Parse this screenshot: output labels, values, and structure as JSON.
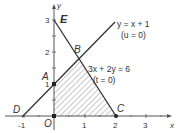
{
  "diagram": {
    "type": "linear-programming-feasible-region",
    "axes": {
      "x_label": "x",
      "y_label": "y",
      "x_ticks": [
        "-1",
        "1",
        "2",
        "3"
      ],
      "y_ticks": [
        "1",
        "2",
        "3"
      ],
      "origin_label": "O"
    },
    "lines": [
      {
        "equation": "y = x + 1",
        "constraint": "(u = 0)"
      },
      {
        "equation": "3x + 2y = 6",
        "constraint": "(t = 0)"
      }
    ],
    "points": {
      "A": "A",
      "B": "B",
      "C": "C",
      "D": "D",
      "E": "E",
      "O": "O"
    },
    "region": {
      "vertices": [
        "O",
        "A",
        "B",
        "C"
      ],
      "fill": "hatched"
    },
    "colors": {
      "line": "#333333",
      "axis": "#555555",
      "hatch": "#777777"
    }
  }
}
